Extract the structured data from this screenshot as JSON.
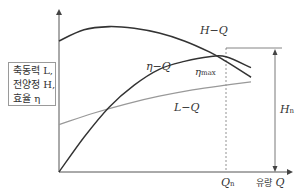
{
  "diagram": {
    "y_axis_label_lines": [
      "축동력 L,",
      "전양정 H,",
      "효율 η"
    ],
    "x_axis_label": {
      "korean": "유량",
      "symbol": "Q"
    },
    "curves": {
      "hq": {
        "label": "H−Q",
        "color": "#333333"
      },
      "etaq": {
        "label": "η−Q",
        "color": "#333333"
      },
      "lq": {
        "label": "L−Q",
        "color": "#999999"
      }
    },
    "eta_max_label": {
      "main": "η",
      "sub": "max"
    },
    "qn_label": {
      "main": "Q",
      "sub": "n"
    },
    "hn_label": {
      "main": "H",
      "sub": "n"
    },
    "colors": {
      "axis": "#555555",
      "curve_dark": "#333333",
      "curve_light": "#999999",
      "guide": "#777777"
    }
  },
  "chart_data": {
    "type": "line",
    "title": "",
    "xlabel": "유량 Q",
    "ylabel": "축동력 L, 전양정 H, 효율 η",
    "x_range": [
      0,
      1.15
    ],
    "y_range": [
      0,
      1.0
    ],
    "qualitative": true,
    "series": [
      {
        "name": "H−Q",
        "x": [
          0,
          0.15,
          0.3,
          0.45,
          0.6,
          0.75,
          0.9,
          1.0,
          1.15
        ],
        "y": [
          0.83,
          0.9,
          0.92,
          0.91,
          0.88,
          0.83,
          0.76,
          0.7,
          0.6
        ]
      },
      {
        "name": "η−Q",
        "x": [
          0,
          0.15,
          0.3,
          0.45,
          0.6,
          0.75,
          0.9,
          1.0,
          1.15
        ],
        "y": [
          0,
          0.22,
          0.41,
          0.55,
          0.65,
          0.7,
          0.73,
          0.73,
          0.66
        ]
      },
      {
        "name": "L−Q",
        "x": [
          0,
          0.2,
          0.4,
          0.6,
          0.8,
          1.0,
          1.15
        ],
        "y": [
          0.3,
          0.37,
          0.43,
          0.48,
          0.52,
          0.55,
          0.57
        ]
      }
    ],
    "annotations": [
      {
        "text": "η max",
        "at_x": 1.0
      },
      {
        "text": "Q n",
        "x": 1.0,
        "kind": "vertical-dashed-line"
      },
      {
        "text": "H n",
        "kind": "vertical-arrow",
        "from_y": 0,
        "to_y": 0.77
      }
    ],
    "grid": false,
    "legend": "none"
  }
}
